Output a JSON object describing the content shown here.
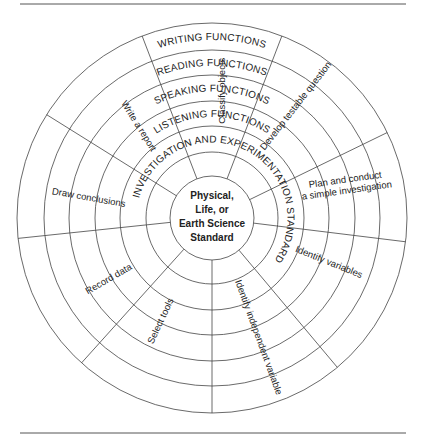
{
  "center_label": [
    "Physical,",
    "Life, or",
    "Earth Science",
    "Standard"
  ],
  "rings": [
    {
      "name": "investigation",
      "label": "INVESTIGATION AND EXPERIMENTATION STANDARD"
    },
    {
      "name": "listening",
      "label": "LISTENING FUNCTIONS"
    },
    {
      "name": "speaking",
      "label": "SPEAKING FUNCTIONS"
    },
    {
      "name": "reading",
      "label": "READING FUNCTIONS"
    },
    {
      "name": "writing",
      "label": "WRITING FUNCTIONS"
    }
  ],
  "segments": [
    {
      "label": "Classify objects"
    },
    {
      "label": "Develop testable question"
    },
    {
      "label": "Plan and conduct a simple investigation"
    },
    {
      "label": "Identify variables"
    },
    {
      "label": "Identify independent variable"
    },
    {
      "label": "Select tools"
    },
    {
      "label": "Record data"
    },
    {
      "label": "Draw conclusions"
    },
    {
      "label": "Write a report"
    }
  ]
}
